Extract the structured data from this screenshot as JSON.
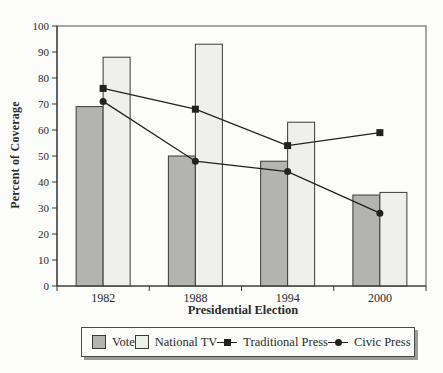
{
  "figure": {
    "y_axis_title": "Percent of Coverage",
    "x_axis_title": "Presidential Election"
  },
  "legend": {
    "items": [
      {
        "label": "Vote",
        "type": "swatch",
        "color": "#b3b3b0"
      },
      {
        "label": "National TV",
        "type": "swatch",
        "color": "#efefeb"
      },
      {
        "label": "Traditional Press",
        "type": "line-square",
        "color": "#222222"
      },
      {
        "label": "Civic Press",
        "type": "line-circle",
        "color": "#222222"
      }
    ]
  },
  "chart_data": {
    "type": "bar",
    "subtype": "bar-line-combo",
    "title": "",
    "xlabel": "Presidential Election",
    "ylabel": "Percent of Coverage",
    "categories": [
      "1982",
      "1988",
      "1994",
      "2000"
    ],
    "bar_series": [
      {
        "name": "Vote",
        "values": [
          69,
          50,
          48,
          35
        ],
        "fill": "#b3b3b0",
        "stroke": "#3a3a3a"
      },
      {
        "name": "National TV",
        "values": [
          88,
          93,
          63,
          36
        ],
        "fill": "#efefeb",
        "stroke": "#3a3a3a"
      }
    ],
    "line_series": [
      {
        "name": "Traditional Press",
        "values": [
          76,
          68,
          54,
          59
        ],
        "marker": "square",
        "color": "#222222"
      },
      {
        "name": "Civic Press",
        "values": [
          71,
          48,
          44,
          28
        ],
        "marker": "circle",
        "color": "#222222"
      }
    ],
    "ylim": [
      0,
      100
    ],
    "yticks": [
      0,
      10,
      20,
      30,
      40,
      50,
      60,
      70,
      80,
      90,
      100
    ],
    "grid": false,
    "legend_position": "bottom"
  }
}
